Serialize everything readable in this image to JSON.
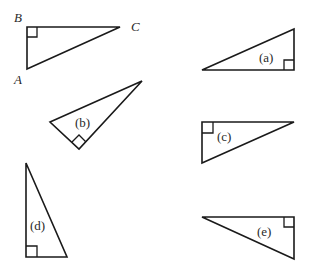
{
  "figure": {
    "reference": {
      "vertex_labels": {
        "A": "A",
        "B": "B",
        "C": "C"
      },
      "right_angle_at": "B"
    },
    "triangles": [
      {
        "id": "a",
        "label": "(a)",
        "right_angle": "bottom-right"
      },
      {
        "id": "b",
        "label": "(b)",
        "right_angle": "bottom"
      },
      {
        "id": "c",
        "label": "(c)",
        "right_angle": "top-left"
      },
      {
        "id": "d",
        "label": "(d)",
        "right_angle": "bottom-left"
      },
      {
        "id": "e",
        "label": "(e)",
        "right_angle": "top-right"
      }
    ],
    "stroke_color": "#1a1a1a",
    "background": "#ffffff"
  }
}
